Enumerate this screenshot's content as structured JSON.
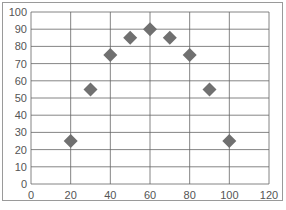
{
  "chart_data": {
    "type": "scatter",
    "title": "",
    "xlabel": "",
    "ylabel": "",
    "xlim": [
      0,
      120
    ],
    "ylim": [
      0,
      100
    ],
    "x_ticks": [
      0,
      20,
      40,
      60,
      80,
      100,
      120
    ],
    "y_ticks": [
      0,
      10,
      20,
      30,
      40,
      50,
      60,
      70,
      80,
      90,
      100
    ],
    "grid": true,
    "legend": null,
    "marker": "diamond",
    "marker_color": "#707070",
    "series": [
      {
        "name": "",
        "x": [
          20,
          30,
          40,
          50,
          60,
          70,
          80,
          90,
          100
        ],
        "y": [
          25,
          55,
          75,
          85,
          90,
          85,
          75,
          55,
          25
        ]
      }
    ]
  },
  "layout": {
    "plot_left": 31,
    "plot_right": 269,
    "plot_top": 12,
    "plot_bottom": 184,
    "grid_color": "#666666",
    "border_color": "#9a9a9a"
  }
}
